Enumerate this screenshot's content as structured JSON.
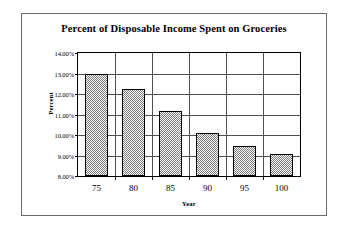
{
  "chart_data": {
    "type": "bar",
    "title": "Percent of Disposable Income Spent on Groceries",
    "xlabel": "Year",
    "ylabel": "Percent",
    "categories": [
      "75",
      "80",
      "85",
      "90",
      "95",
      "100"
    ],
    "values": [
      13.0,
      12.25,
      11.15,
      10.1,
      9.45,
      9.05
    ],
    "ylim": [
      8.0,
      14.0
    ],
    "ytick_values": [
      8.0,
      9.0,
      10.0,
      11.0,
      12.0,
      13.0,
      14.0
    ],
    "ytick_labels": [
      "8.00%",
      "9.00%",
      "10.00%",
      "11.00%",
      "12.00%",
      "13.00%",
      "14.00%"
    ],
    "grid": true,
    "legend": null,
    "series": [
      {
        "name": "Percent of Disposable Income Spent on Groceries",
        "values": [
          13.0,
          12.25,
          11.15,
          10.1,
          9.45,
          9.05
        ],
        "fill": "#7d7d7d",
        "fill_pattern": "checkered-dither",
        "border_color": "#000000"
      }
    ],
    "colors": {
      "bar_fill": "#7d7d7d",
      "bar_border": "#000000",
      "gridline": "#4f4f4f",
      "axis": "#000000",
      "frame": "#6b6b6b",
      "background": "#ffffff",
      "text": "#000000"
    }
  }
}
